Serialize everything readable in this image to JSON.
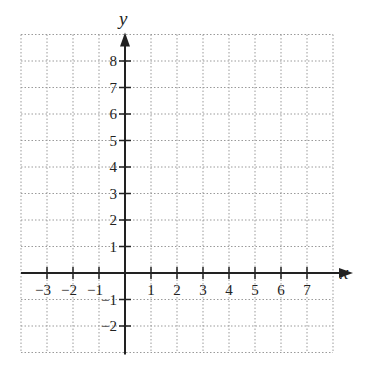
{
  "chart_data": {
    "type": "scatter",
    "title": "",
    "xlabel": "x",
    "ylabel": "y",
    "xlim": [
      -4,
      8
    ],
    "ylim": [
      -3,
      9
    ],
    "grid": true,
    "grid_style": "dotted",
    "x_ticks": [
      -3,
      -2,
      -1,
      1,
      2,
      3,
      4,
      5,
      6,
      7
    ],
    "y_ticks": [
      8,
      7,
      6,
      5,
      4,
      3,
      2,
      1,
      -1,
      -2
    ],
    "x_tick_labels": [
      "−3",
      "−2",
      "−1",
      "1",
      "2",
      "3",
      "4",
      "5",
      "6",
      "7"
    ],
    "y_tick_labels": [
      "8",
      "7",
      "6",
      "5",
      "4",
      "3",
      "2",
      "1",
      "−1",
      "−2"
    ],
    "series": [],
    "colors": {
      "axis": "#222222",
      "grid": "#9a9a9a",
      "background": "#ffffff"
    }
  },
  "labels": {
    "x_axis": "x",
    "y_axis": "y"
  }
}
